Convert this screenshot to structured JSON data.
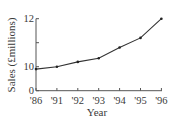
{
  "chart_data": {
    "type": "line",
    "title": "",
    "xlabel": "Year",
    "ylabel": "Sales (£millions)",
    "categories": [
      "'86",
      "'91",
      "'92",
      "'93",
      "'94",
      "'95",
      "'96"
    ],
    "values": [
      9.9,
      10.0,
      10.2,
      10.35,
      10.8,
      11.2,
      12.0
    ],
    "yticks": [
      {
        "value": 0,
        "label": "0"
      },
      {
        "value": 10,
        "label": "10"
      },
      {
        "value": 11,
        "label": ""
      },
      {
        "value": 12,
        "label": "12"
      }
    ],
    "axis_break": "y-axis jumps from 0 to 10",
    "ylim": [
      0,
      12
    ],
    "grid": false,
    "legend": null,
    "markers": true,
    "colors": {
      "line": "#333333",
      "axis": "#555555",
      "text": "#3a3a3a"
    }
  }
}
